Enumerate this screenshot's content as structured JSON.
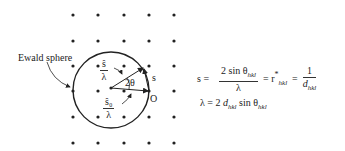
{
  "diagram": {
    "label_ewald": "Ewald sphere",
    "label_s_hat": "ŝ",
    "label_s0_hat": "ŝ₀",
    "label_lambda": "λ",
    "label_angle": "2θ",
    "label_s": "s",
    "label_origin": "O",
    "lattice": {
      "columns_x": [
        73,
        98,
        124,
        149,
        174
      ],
      "rows_y": [
        15,
        41,
        66,
        91,
        117,
        143
      ]
    },
    "circle": {
      "cx": 111,
      "cy": 88,
      "r": 38
    }
  },
  "equations": {
    "eq1_lhs": "s  =",
    "eq1_num": "2 sin θ",
    "eq1_num_sub": "hkl",
    "eq1_den": "λ",
    "eq1_mid": "=  r",
    "eq1_mid_sup": "*",
    "eq1_mid_sub": "hkl",
    "eq1_eq2": "=",
    "eq1_frac2_num": "1",
    "eq1_frac2_den": "d",
    "eq1_frac2_den_sub": "hkl",
    "eq2_a": "λ = 2 ",
    "eq2_d": "d",
    "eq2_d_sub": "hkl",
    "eq2_sin": " sin θ",
    "eq2_sin_sub": "hkl"
  }
}
